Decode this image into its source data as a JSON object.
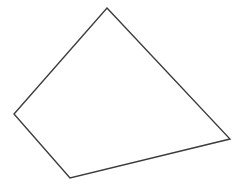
{
  "figure": {
    "title": "",
    "background_color": "#ffffff",
    "width": 246,
    "height": 191
  },
  "chart_data": {
    "type": "diagram",
    "shape_kind": "quadrilateral",
    "title": "",
    "xlabel": "",
    "ylabel": "",
    "grid": false,
    "legend": false,
    "axis_visible": false,
    "xlim": [
      0,
      246
    ],
    "ylim": [
      0,
      191
    ],
    "shapes": [
      {
        "name": "quadrilateral-outline",
        "closed": true,
        "fill": "none",
        "stroke_color": "#3c3c3c",
        "stroke_width": 1.4,
        "vertex_count": 4,
        "vertices": [
          {
            "label": "apex",
            "x": 107,
            "y": 8
          },
          {
            "label": "right",
            "x": 230,
            "y": 139
          },
          {
            "label": "bottom",
            "x": 70,
            "y": 178
          },
          {
            "label": "left",
            "x": 14,
            "y": 114
          }
        ],
        "points_attr": "107,8 230,139 70,178 14,114",
        "edges": [
          {
            "name": "apex-to-right",
            "from": "apex",
            "to": "right"
          },
          {
            "name": "right-to-bottom",
            "from": "right",
            "to": "bottom"
          },
          {
            "name": "bottom-to-left",
            "from": "bottom",
            "to": "left"
          },
          {
            "name": "left-to-apex",
            "from": "left",
            "to": "apex"
          }
        ]
      }
    ]
  }
}
